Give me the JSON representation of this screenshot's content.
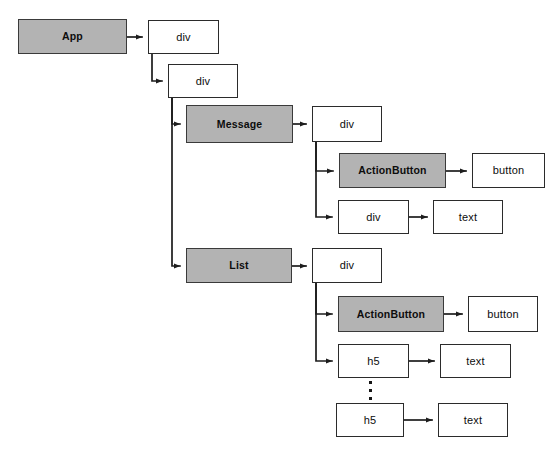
{
  "diagram": {
    "colors": {
      "component_fill": "#b3b3b3",
      "element_fill": "#ffffff",
      "stroke": "#2b2b2b",
      "background": "#ffffff"
    },
    "nodes": [
      {
        "id": "app",
        "label": "App",
        "kind": "component",
        "x": 18,
        "y": 19,
        "w": 109,
        "h": 35
      },
      {
        "id": "div_root",
        "label": "div",
        "kind": "element",
        "x": 148,
        "y": 20,
        "w": 71,
        "h": 34
      },
      {
        "id": "div_inner",
        "label": "div",
        "kind": "element",
        "x": 168,
        "y": 64,
        "w": 70,
        "h": 34
      },
      {
        "id": "message",
        "label": "Message",
        "kind": "component",
        "x": 186,
        "y": 105,
        "w": 107,
        "h": 38
      },
      {
        "id": "msg_div",
        "label": "div",
        "kind": "element",
        "x": 312,
        "y": 106,
        "w": 70,
        "h": 36
      },
      {
        "id": "msg_actionbtn",
        "label": "ActionButton",
        "kind": "component",
        "x": 339,
        "y": 153,
        "w": 107,
        "h": 35
      },
      {
        "id": "msg_button",
        "label": "button",
        "kind": "element",
        "x": 472,
        "y": 153,
        "w": 73,
        "h": 35
      },
      {
        "id": "msg_div2",
        "label": "div",
        "kind": "element",
        "x": 338,
        "y": 200,
        "w": 71,
        "h": 34
      },
      {
        "id": "msg_text",
        "label": "text",
        "kind": "element",
        "x": 433,
        "y": 200,
        "w": 70,
        "h": 34
      },
      {
        "id": "list",
        "label": "List",
        "kind": "component",
        "x": 186,
        "y": 248,
        "w": 106,
        "h": 35
      },
      {
        "id": "list_div",
        "label": "div",
        "kind": "element",
        "x": 312,
        "y": 248,
        "w": 70,
        "h": 35
      },
      {
        "id": "list_actionbtn",
        "label": "ActionButton",
        "kind": "component",
        "x": 338,
        "y": 296,
        "w": 106,
        "h": 36
      },
      {
        "id": "list_button",
        "label": "button",
        "kind": "element",
        "x": 468,
        "y": 296,
        "w": 70,
        "h": 36
      },
      {
        "id": "list_h5_first",
        "label": "h5",
        "kind": "element",
        "x": 338,
        "y": 344,
        "w": 71,
        "h": 34
      },
      {
        "id": "list_text_first",
        "label": "text",
        "kind": "element",
        "x": 440,
        "y": 344,
        "w": 71,
        "h": 34
      },
      {
        "id": "list_h5_last",
        "label": "h5",
        "kind": "element",
        "x": 336,
        "y": 403,
        "w": 68,
        "h": 34
      },
      {
        "id": "list_text_last",
        "label": "text",
        "kind": "element",
        "x": 438,
        "y": 403,
        "w": 70,
        "h": 34
      }
    ],
    "ellipsis": {
      "x": 368,
      "y": 381,
      "dots": 3
    },
    "edges": [
      {
        "id": "app-to-div",
        "from": "app",
        "to": "div_root",
        "type": "straight"
      },
      {
        "id": "div-to-div",
        "from": "div_root",
        "to": "div_inner",
        "type": "elbow"
      },
      {
        "id": "div-to-message",
        "from": "div_inner",
        "to": "message",
        "type": "elbow"
      },
      {
        "id": "div-to-list",
        "from": "div_inner",
        "to": "list",
        "type": "elbow"
      },
      {
        "id": "message-to-div",
        "from": "message",
        "to": "msg_div",
        "type": "straight"
      },
      {
        "id": "msgdiv-to-actionbutton",
        "from": "msg_div",
        "to": "msg_actionbtn",
        "type": "elbow"
      },
      {
        "id": "msgdiv-to-div",
        "from": "msg_div",
        "to": "msg_div2",
        "type": "elbow"
      },
      {
        "id": "actionbutton-to-button",
        "from": "msg_actionbtn",
        "to": "msg_button",
        "type": "straight"
      },
      {
        "id": "msgdiv2-to-text",
        "from": "msg_div2",
        "to": "msg_text",
        "type": "straight"
      },
      {
        "id": "list-to-div",
        "from": "list",
        "to": "list_div",
        "type": "straight"
      },
      {
        "id": "listdiv-to-actionbutton",
        "from": "list_div",
        "to": "list_actionbtn",
        "type": "elbow"
      },
      {
        "id": "listdiv-to-h5",
        "from": "list_div",
        "to": "list_h5_first",
        "type": "elbow"
      },
      {
        "id": "listactionbtn-to-button",
        "from": "list_actionbtn",
        "to": "list_button",
        "type": "straight"
      },
      {
        "id": "h5-to-text-first",
        "from": "list_h5_first",
        "to": "list_text_first",
        "type": "straight"
      },
      {
        "id": "h5-to-text-last",
        "from": "list_h5_last",
        "to": "list_text_last",
        "type": "straight"
      }
    ]
  }
}
